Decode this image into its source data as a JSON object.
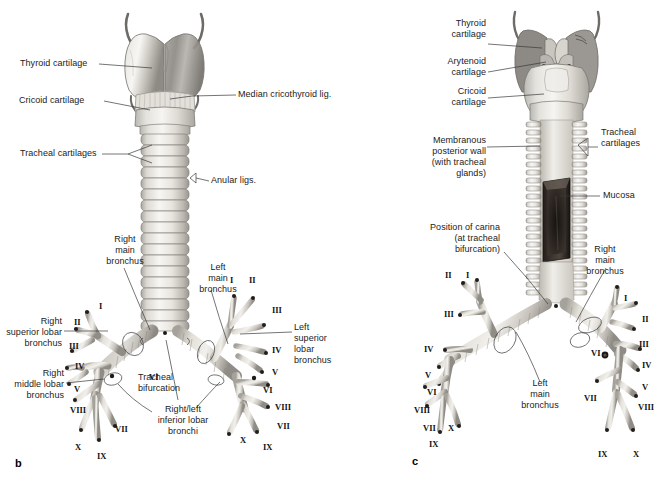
{
  "figure": {
    "type": "anatomical-illustration",
    "background_color": "#ffffff",
    "ink_color": "#1b1b1b",
    "leader_line_color": "#3a3a3a"
  },
  "panels": [
    {
      "id": "b",
      "id_label": "b",
      "view": "anterior",
      "labels": [
        {
          "key": "thyroid_cartilage",
          "text": "Thyroid cartilage"
        },
        {
          "key": "cricoid_cartilage",
          "text": "Cricoid cartilage"
        },
        {
          "key": "tracheal_cartilages",
          "text": "Tracheal cartilages"
        },
        {
          "key": "median_cricothyroid",
          "text": "Median cricothyroid lig."
        },
        {
          "key": "anular_ligs",
          "text": "Anular ligs."
        },
        {
          "key": "right_main_bronchus",
          "text": "Right\nmain\nbronchus"
        },
        {
          "key": "left_main_bronchus",
          "text": "Left\nmain\nbronchus"
        },
        {
          "key": "right_superior_lobar",
          "text": "Right\nsuperior lobar\nbronchus"
        },
        {
          "key": "left_superior_lobar",
          "text": "Left\nsuperior\nlobar\nbronchus"
        },
        {
          "key": "right_middle_lobar",
          "text": "Right\nmiddle lobar\nbronchus"
        },
        {
          "key": "tracheal_bifurcation",
          "text": "Tracheal\nbifurcation"
        },
        {
          "key": "inferior_lobar",
          "text": "Right/left\ninferior lobar\nbronchi"
        }
      ],
      "segment_numerals_left": [
        "I",
        "II",
        "III",
        "IV",
        "V",
        "VIII",
        "VII",
        "X",
        "IX",
        "VI"
      ],
      "segment_numerals_right": [
        "I",
        "II",
        "III",
        "IV",
        "V",
        "VI",
        "VIII",
        "VII",
        "X",
        "IX"
      ]
    },
    {
      "id": "c",
      "id_label": "c",
      "view": "posterior",
      "labels": [
        {
          "key": "thyroid_cartilage",
          "text": "Thyroid\ncartilage"
        },
        {
          "key": "arytenoid_cartilage",
          "text": "Arytenoid\ncartilage"
        },
        {
          "key": "cricoid_cartilage",
          "text": "Cricoid\ncartilage"
        },
        {
          "key": "membranous_wall",
          "text": "Membranous\nposterior wall\n(with tracheal\nglands)"
        },
        {
          "key": "tracheal_cartilages",
          "text": "Tracheal\ncartilages"
        },
        {
          "key": "mucosa",
          "text": "Mucosa"
        },
        {
          "key": "carina",
          "text": "Position of carina\n(at tracheal\nbifurcation)"
        },
        {
          "key": "right_main_bronchus",
          "text": "Right\nmain\nbronchus"
        },
        {
          "key": "left_main_bronchus",
          "text": "Left\nmain\nbronchus"
        }
      ],
      "segment_numerals_left": [
        "II",
        "I",
        "III",
        "IV",
        "V",
        "VI",
        "VIII",
        "VII",
        "X",
        "IX"
      ],
      "segment_numerals_right": [
        "I",
        "II",
        "III",
        "IV",
        "V",
        "VI",
        "VII",
        "VIII",
        "IX",
        "X"
      ]
    }
  ],
  "panel_b": {
    "thyroid_cartilage": "Thyroid cartilage",
    "cricoid_cartilage": "Cricoid cartilage",
    "tracheal_cartilages": "Tracheal cartilages",
    "median_cricothyroid_lig": "Median cricothyroid lig.",
    "anular_ligs": "Anular ligs.",
    "right_main_bronchus_l1": "Right",
    "right_main_bronchus_l2": "main",
    "right_main_bronchus_l3": "bronchus",
    "left_main_bronchus_l1": "Left",
    "left_main_bronchus_l2": "main",
    "left_main_bronchus_l3": "bronchus",
    "right_superior_lobar_l1": "Right",
    "right_superior_lobar_l2": "superior lobar",
    "right_superior_lobar_l3": "bronchus",
    "left_superior_lobar_l1": "Left",
    "left_superior_lobar_l2": "superior",
    "left_superior_lobar_l3": "lobar",
    "left_superior_lobar_l4": "bronchus",
    "right_middle_lobar_l1": "Right",
    "right_middle_lobar_l2": "middle lobar",
    "right_middle_lobar_l3": "bronchus",
    "tracheal_bifurcation_l1": "Tracheal",
    "tracheal_bifurcation_l2": "bifurcation",
    "inferior_lobar_l1": "Right/left",
    "inferior_lobar_l2": "inferior lobar",
    "inferior_lobar_l3": "bronchi",
    "panel_id": "b",
    "n_left_I": "I",
    "n_left_II": "II",
    "n_left_III": "III",
    "n_left_IV": "IV",
    "n_left_V": "V",
    "n_left_VI": "VI",
    "n_left_VII": "VII",
    "n_left_VIII": "VIII",
    "n_left_IX": "IX",
    "n_left_X": "X",
    "n_right_I": "I",
    "n_right_II": "II",
    "n_right_III": "III",
    "n_right_IV": "IV",
    "n_right_V": "V",
    "n_right_VI": "VI",
    "n_right_VII": "VII",
    "n_right_VIII": "VIII",
    "n_right_IX": "IX",
    "n_right_X": "X"
  },
  "panel_c": {
    "thyroid_cartilage_l1": "Thyroid",
    "thyroid_cartilage_l2": "cartilage",
    "arytenoid_cartilage_l1": "Arytenoid",
    "arytenoid_cartilage_l2": "cartilage",
    "cricoid_cartilage_l1": "Cricoid",
    "cricoid_cartilage_l2": "cartilage",
    "membranous_l1": "Membranous",
    "membranous_l2": "posterior wall",
    "membranous_l3": "(with tracheal",
    "membranous_l4": "glands)",
    "tracheal_cartilages_l1": "Tracheal",
    "tracheal_cartilages_l2": "cartilages",
    "mucosa": "Mucosa",
    "carina_l1": "Position of carina",
    "carina_l2": "(at tracheal",
    "carina_l3": "bifurcation)",
    "right_main_bronchus_l1": "Right",
    "right_main_bronchus_l2": "main",
    "right_main_bronchus_l3": "bronchus",
    "left_main_bronchus_l1": "Left",
    "left_main_bronchus_l2": "main",
    "left_main_bronchus_l3": "bronchus",
    "panel_id": "c",
    "n_left_I": "I",
    "n_left_II": "II",
    "n_left_III": "III",
    "n_left_IV": "IV",
    "n_left_V": "V",
    "n_left_VI": "VI",
    "n_left_VII": "VII",
    "n_left_VIII": "VIII",
    "n_left_IX": "IX",
    "n_left_X": "X",
    "n_right_I": "I",
    "n_right_II": "II",
    "n_right_III": "III",
    "n_right_IV": "IV",
    "n_right_V": "V",
    "n_right_VI": "VI",
    "n_right_VII": "VII",
    "n_right_VIII": "VIII",
    "n_right_IX": "IX",
    "n_right_X": "X"
  }
}
